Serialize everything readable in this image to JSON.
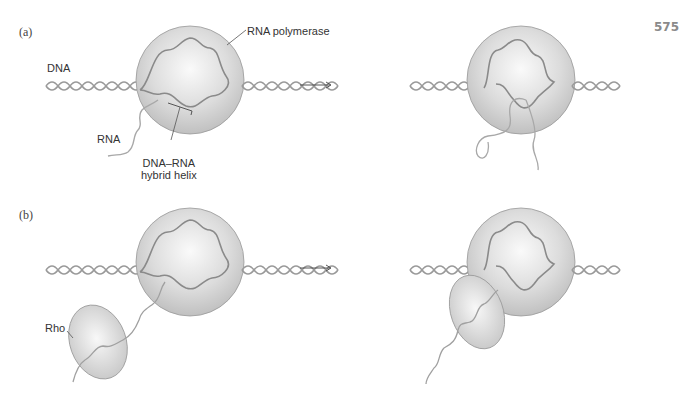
{
  "page_number": "575",
  "panels": [
    {
      "id": "a",
      "label": "(a)",
      "labels": {
        "dna": "DNA",
        "rna": "RNA",
        "polymerase": "RNA polymerase",
        "hybrid_line1": "DNA–RNA",
        "hybrid_line2": "hybrid helix"
      }
    },
    {
      "id": "b",
      "label": "(b)",
      "labels": {
        "rho": "Rho"
      }
    }
  ],
  "arrow": "→",
  "colors": {
    "strand": "#9a9a9a",
    "sphere_light": "#f4f4f4",
    "sphere_dark": "#c4c4c4",
    "outline": "#8c8c8c",
    "text": "#333333"
  }
}
